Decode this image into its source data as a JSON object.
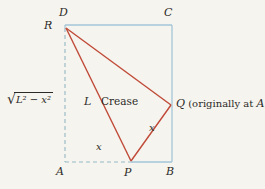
{
  "figure": {
    "description_labels": {
      "crease": "Crease",
      "crease_length": "L",
      "radical_sign": "√",
      "radical_expr": "L² − x²",
      "x_bottom": "x",
      "x_right": "x"
    },
    "vertices": {
      "d": "D",
      "c": "C",
      "a": "A",
      "b": "B",
      "r": "R",
      "p": "P"
    },
    "q_annotation": {
      "point": "Q",
      "text_open": "(originally at",
      "point_ref": "A",
      "text_close": ")"
    },
    "colors": {
      "paper_edge": "#a3c6d8",
      "hidden_edge": "#93b9c6",
      "crease_red": "#c04a38",
      "text": "#2b2a28",
      "background": "#f6f4ee"
    }
  }
}
